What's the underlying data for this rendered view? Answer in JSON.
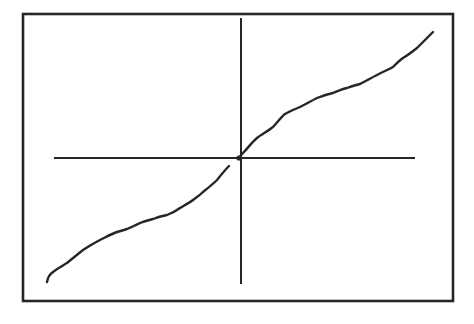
{
  "figure": {
    "colors": {
      "background": "#ffffff",
      "ink": "#262626"
    },
    "frame": {
      "x1": 23,
      "y1": 14,
      "x2": 453,
      "y2": 301
    },
    "x_axis": {
      "x1": 54,
      "y1": 158,
      "x2": 415,
      "y2": 158
    },
    "y_axis": {
      "x1": 241,
      "y1": 18,
      "x2": 241,
      "y2": 284
    },
    "origin": {
      "x": 239,
      "y": 158
    },
    "curve_lower": "M47,282 C48,276 50,274 53,272 C58,268 62,266 67,263 C73,258 78,254 83,250 C89,246 94,243 100,240 C106,237 111,234 117,232 C121,231 124,230 127,229 C132,227 136,225 140,223 C145,221 149,220 153,219 C158,217 162,216 167,215 C172,213 176,211 180,208 C185,205 189,203 193,200 C197,197 200,195 203,192 C208,188 213,184 217,180 C221,175 225,170 229,166",
    "curve_upper": "M239,158 C241,155 242,154 243,153 C248,148 252,142 257,138 C262,134 268,131 273,127 C277,123 281,117 285,114 C290,111 295,109 300,107 C306,104 311,101 317,98 C322,96 328,94 333,93 C338,91 342,89 347,88 C352,86 356,85 360,84 C366,81 371,78 377,75 C382,72 388,70 393,67 C397,63 400,60 403,58 C408,55 412,52 417,48 C422,43 428,37 433,32"
  },
  "chart_data": {
    "type": "line",
    "title": "",
    "xlabel": "",
    "ylabel": "",
    "grid": false,
    "legend": null,
    "axes": "crossing at origin, no ticks or labels",
    "note": "Sketch of an increasing odd function (e.g. y = x + c·x^3 shape inverted; steep near ends, gentler in the middle), positions normalized so origin=(0,0), x in [-1,1]",
    "series": [
      {
        "name": "curve",
        "x": [
          -1.0,
          -0.97,
          -0.9,
          -0.82,
          -0.73,
          -0.64,
          -0.59,
          -0.52,
          -0.45,
          -0.38,
          -0.31,
          -0.24,
          -0.19,
          -0.12,
          -0.05,
          0.0,
          0.02,
          0.09,
          0.18,
          0.24,
          0.32,
          0.4,
          0.49,
          0.56,
          0.62,
          0.71,
          0.79,
          0.84,
          0.92,
          1.0
        ],
        "y": [
          -1.0,
          -0.92,
          -0.85,
          -0.74,
          -0.66,
          -0.6,
          -0.57,
          -0.52,
          -0.49,
          -0.46,
          -0.4,
          -0.34,
          -0.27,
          -0.18,
          -0.07,
          0.0,
          0.04,
          0.16,
          0.25,
          0.35,
          0.41,
          0.48,
          0.52,
          0.56,
          0.59,
          0.66,
          0.73,
          0.8,
          0.88,
          1.0
        ]
      }
    ]
  }
}
